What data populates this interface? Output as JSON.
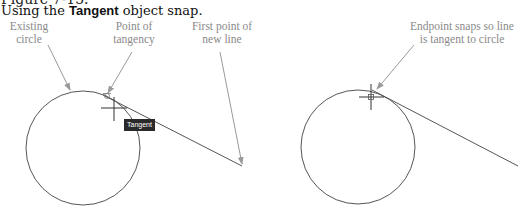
{
  "figure": {
    "number_label": "Figure 7-15.",
    "caption_prefix": "Using the ",
    "caption_bold": "Tangent",
    "caption_suffix": " object snap."
  },
  "left_panel": {
    "callouts": [
      {
        "line1": "Existing",
        "line2": "circle"
      },
      {
        "line1": "Point of",
        "line2": "tangency"
      },
      {
        "line1": "First point of",
        "line2": "new line"
      }
    ],
    "tooltip": "Tangent",
    "icons": [
      "crosshair-cursor-icon",
      "tangent-snap-marker-icon"
    ]
  },
  "right_panel": {
    "callouts": [
      {
        "line1": "Endpoint snaps so line",
        "line2": "is tangent to circle"
      }
    ],
    "icons": [
      "crosshair-cursor-icon",
      "endpoint-snap-marker-icon"
    ]
  },
  "colors": {
    "drawing_line": "#555555",
    "callout_text": "#8a8a8a",
    "leader_arrow": "#9a9a9a",
    "tooltip_bg": "#2a2a2a",
    "tooltip_text": "#ffffff"
  }
}
